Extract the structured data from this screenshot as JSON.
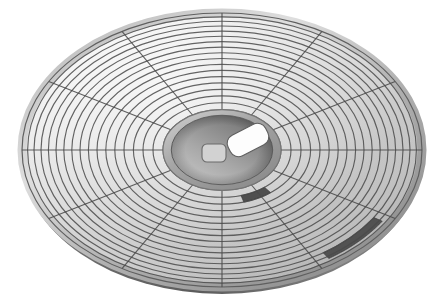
{
  "scene": {
    "title": "Perspective view of a segmented circular disc platter",
    "background_color": "#ffffff",
    "width": 433,
    "height": 302,
    "object_name": "segmented-disc-platter",
    "view": "oblique-perspective"
  },
  "disc": {
    "center_x": 222,
    "center_y": 150,
    "radius_x": 200,
    "radius_y": 137,
    "edge_thickness": 7,
    "top_face_color_light": "#fbfbfb",
    "top_face_color_mid": "#d8d8d8",
    "top_face_color_dark": "#a6a6a6",
    "rim_color": "#8e8e8e",
    "edge_side_color": "#6f6f6f",
    "outline_color": "#5a5a5a",
    "grid_line_color": "#4a4a4a",
    "grid_line_width": 1.15
  },
  "grid": {
    "ring_count": 14,
    "inner_ring_fraction": 0.295,
    "ring_fractions": [
      0.295,
      0.345,
      0.395,
      0.443,
      0.49,
      0.536,
      0.581,
      0.625,
      0.668,
      0.71,
      0.751,
      0.791,
      0.83,
      0.868,
      0.905,
      0.94,
      0.972,
      1.0
    ],
    "spoke_count": 12,
    "spoke_angles_deg": [
      0,
      30,
      60,
      90,
      120,
      150,
      180,
      210,
      240,
      270,
      300,
      330
    ],
    "spoke_label": "radial-divider"
  },
  "hub": {
    "name": "center-hub",
    "radius_x_fraction": 0.295,
    "radius_y_fraction": 0.295,
    "ring_color_outer": "#b4b4b4",
    "ring_color_inner": "#8d8d8d",
    "face_color_light": "#c9c9c9",
    "face_color_dark": "#7b7b7b",
    "cutouts": [
      {
        "name": "small-square-port",
        "shape": "rounded-square",
        "cx": 214,
        "cy": 153,
        "w": 24,
        "h": 18,
        "rx": 5,
        "rotation_deg": 0,
        "fill": "#d2d2d2",
        "stroke": "#6b6b6b"
      },
      {
        "name": "spindle-slot",
        "shape": "rounded-rect",
        "cx": 248,
        "cy": 140,
        "w": 42,
        "h": 23,
        "rx": 9,
        "rotation_deg": -27,
        "fill": "#fdfdfd",
        "stroke": "#5f5f5f"
      }
    ]
  },
  "highlighted_cells": [
    {
      "name": "highlighted-cell-inner",
      "ring_index": 1,
      "spoke_sector_index": 9,
      "angle_start_deg": 52,
      "angle_end_deg": 74,
      "r_inner_fraction": 0.345,
      "r_outer_fraction": 0.395,
      "fill": "#4f4f4f"
    },
    {
      "name": "highlighted-cell-outer",
      "ring_index": 11,
      "spoke_sector_index": 8,
      "angle_start_deg": 33,
      "angle_end_deg": 56,
      "r_inner_fraction": 0.905,
      "r_outer_fraction": 0.955,
      "fill": "#525252"
    }
  ],
  "legend": {
    "shadow_side": "bottom-right",
    "light_source": "upper-left"
  }
}
